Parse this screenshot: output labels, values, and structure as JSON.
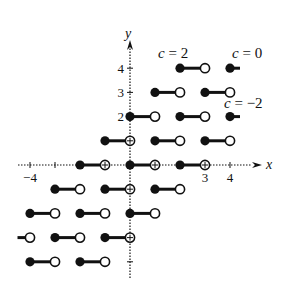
{
  "figure": {
    "origin_px": [
      130,
      165
    ],
    "unit_px": [
      25,
      24.2
    ],
    "axes": {
      "x_label": "x",
      "y_label": "y",
      "x_ticks": [
        -4,
        -3,
        -2,
        -1,
        1,
        2,
        3,
        4
      ],
      "y_ticks": [
        -4,
        -3,
        -2,
        -1,
        1,
        2,
        3,
        4
      ],
      "x_tick_labels": [
        {
          "value": -4,
          "text": "−4"
        },
        {
          "value": 3,
          "text": "3"
        },
        {
          "value": 4,
          "text": "4"
        }
      ],
      "y_tick_labels": [
        {
          "value": 2,
          "text": "2"
        },
        {
          "value": 3,
          "text": "3"
        },
        {
          "value": 4,
          "text": "4"
        }
      ]
    },
    "curve_labels": [
      {
        "text": "c = 2",
        "x_px": 158,
        "y_px": 58
      },
      {
        "text": "c = 0",
        "x_px": 232,
        "y_px": 58
      },
      {
        "text": "c = −2",
        "x_px": 224,
        "y_px": 108
      }
    ],
    "segments": [
      {
        "y": 4,
        "x0": 2,
        "x1": 3,
        "start": "filled",
        "end": "open"
      },
      {
        "y": 4,
        "x0": 4,
        "x1": 4.4,
        "start": "filled",
        "end": "none"
      },
      {
        "y": 3,
        "x0": 1,
        "x1": 2,
        "start": "filled",
        "end": "open"
      },
      {
        "y": 3,
        "x0": 3,
        "x1": 4,
        "start": "filled",
        "end": "open"
      },
      {
        "y": 2,
        "x0": 0,
        "x1": 1,
        "start": "filled",
        "end": "open"
      },
      {
        "y": 2,
        "x0": 2,
        "x1": 3,
        "start": "filled",
        "end": "open"
      },
      {
        "y": 2,
        "x0": 4,
        "x1": 4.4,
        "start": "filled",
        "end": "none"
      },
      {
        "y": 1,
        "x0": -1,
        "x1": 0,
        "start": "filled",
        "end": "cross"
      },
      {
        "y": 1,
        "x0": 1,
        "x1": 2,
        "start": "filled",
        "end": "open"
      },
      {
        "y": 1,
        "x0": 3,
        "x1": 4,
        "start": "filled",
        "end": "open"
      },
      {
        "y": 0,
        "x0": -2,
        "x1": -1,
        "start": "filled",
        "end": "cross"
      },
      {
        "y": 0,
        "x0": 0,
        "x1": 1,
        "start": "filled",
        "end": "cross"
      },
      {
        "y": 0,
        "x0": 2,
        "x1": 3,
        "start": "filled",
        "end": "cross"
      },
      {
        "y": -1,
        "x0": -3,
        "x1": -2,
        "start": "filled",
        "end": "open"
      },
      {
        "y": -1,
        "x0": -1,
        "x1": 0,
        "start": "filled",
        "end": "cross"
      },
      {
        "y": -1,
        "x0": 1,
        "x1": 2,
        "start": "filled",
        "end": "open"
      },
      {
        "y": -2,
        "x0": -4,
        "x1": -3,
        "start": "filled",
        "end": "open"
      },
      {
        "y": -2,
        "x0": -2,
        "x1": -1,
        "start": "filled",
        "end": "open"
      },
      {
        "y": -2,
        "x0": 0,
        "x1": 1,
        "start": "filled",
        "end": "open"
      },
      {
        "y": -3,
        "x0": -4.5,
        "x1": -4,
        "start": "none",
        "end": "open"
      },
      {
        "y": -3,
        "x0": -3,
        "x1": -2,
        "start": "filled",
        "end": "open"
      },
      {
        "y": -3,
        "x0": -1,
        "x1": 0,
        "start": "filled",
        "end": "cross"
      },
      {
        "y": -4,
        "x0": -4,
        "x1": -3,
        "start": "filled",
        "end": "open"
      },
      {
        "y": -4,
        "x0": -2,
        "x1": -1,
        "start": "filled",
        "end": "open"
      }
    ],
    "colors": {
      "ink": "#111111",
      "background": "#ffffff"
    }
  }
}
